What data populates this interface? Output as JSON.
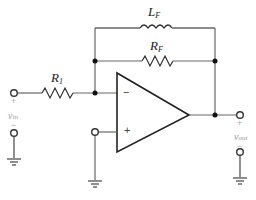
{
  "diagram": {
    "components": {
      "inductor_feedback": {
        "symbol": "L",
        "subscript": "F"
      },
      "resistor_feedback": {
        "symbol": "R",
        "subscript": "F"
      },
      "resistor_input": {
        "symbol": "R",
        "subscript": "1"
      }
    },
    "opamp": {
      "inverting_sign": "−",
      "noninverting_sign": "+"
    },
    "terminals": {
      "input": {
        "plus": "+",
        "minus": "−",
        "label": "v",
        "label_sub": "in"
      },
      "output": {
        "plus": "+",
        "minus": "−",
        "label": "v",
        "label_sub": "out"
      }
    },
    "colors": {
      "wire": "#555555",
      "symbol": "#222222",
      "faint_label": "#999999"
    }
  }
}
